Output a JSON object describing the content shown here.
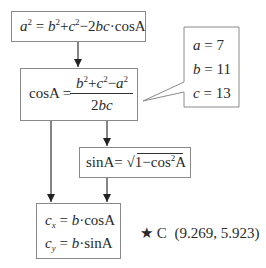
{
  "diagram": {
    "box_law_of_cosines": {
      "lhs_base": "a",
      "lhs_exp": "2",
      "eq": "=",
      "t1_base": "b",
      "t1_exp": "2",
      "plus": "+",
      "t2_base": "c",
      "t2_exp": "2",
      "minus": "−2",
      "t3": "bc",
      "dot": "·",
      "func": "cosA"
    },
    "box_cosA": {
      "lhs": "cosA",
      "eq": "=",
      "num_b": "b",
      "num_b_exp": "2",
      "num_plus": "+",
      "num_c": "c",
      "num_c_exp": "2",
      "num_minus": "−",
      "num_a": "a",
      "num_a_exp": "2",
      "den_coef": "2",
      "den_vars": "bc"
    },
    "callout_values": {
      "a_label": "a",
      "a_eq": " = 7",
      "b_label": "b",
      "b_eq": " = 11",
      "c_label": "c",
      "c_eq": " = 13"
    },
    "box_sinA": {
      "lhs": "sinA",
      "eq": "=",
      "radical": "√",
      "rad_one": "1",
      "rad_minus": "−",
      "rad_cos": "cos",
      "rad_exp": "2",
      "rad_A": "A"
    },
    "box_coords": {
      "cx_base": "c",
      "cx_sub": "x",
      "cx_rhs_var": "b",
      "cx_rhs": "·cosA",
      "cy_base": "c",
      "cy_sub": "y",
      "cy_rhs_var": "b",
      "cy_rhs": "·sinA",
      "eq": " = "
    },
    "result": {
      "star": "★",
      "label": "C",
      "coords": "(9.269, 5.923)"
    }
  }
}
